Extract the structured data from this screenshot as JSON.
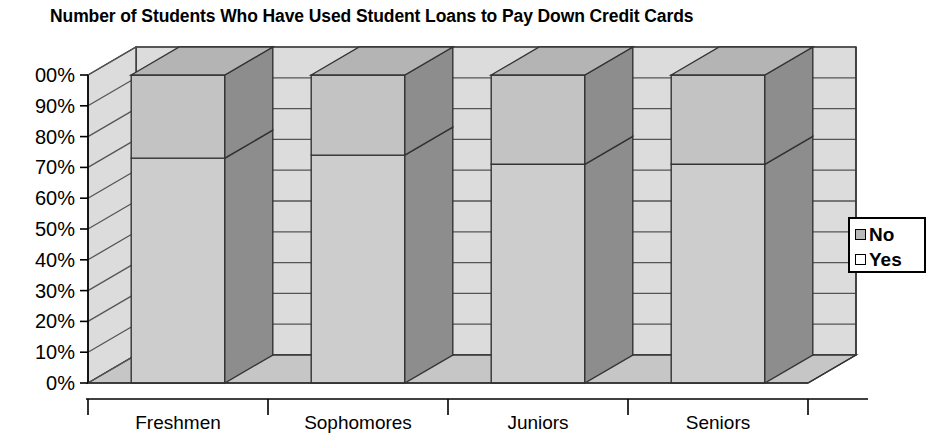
{
  "chart_data": {
    "type": "bar",
    "subtype": "stacked-column-3d",
    "title": "Number of Students Who Have Used Student Loans to Pay Down Credit Cards",
    "xlabel": "",
    "ylabel": "",
    "categories": [
      "Freshmen",
      "Sophomores",
      "Juniors",
      "Seniors"
    ],
    "series": [
      {
        "name": "Yes",
        "values": [
          73,
          74,
          71,
          71
        ],
        "color": "#c9c9c9"
      },
      {
        "name": "No",
        "values": [
          27,
          26,
          29,
          29
        ],
        "color": "#b8b8b8"
      }
    ],
    "ylim": [
      0,
      100
    ],
    "ytick_labels": [
      "00%",
      "90%",
      "80%",
      "70%",
      "60%",
      "50%",
      "40%",
      "30%",
      "20%",
      "10%",
      "0%"
    ],
    "ytick_values": [
      100,
      90,
      80,
      70,
      60,
      50,
      40,
      30,
      20,
      10,
      0
    ],
    "grid": true,
    "legend_position": "right",
    "legend_entries": [
      "No",
      "Yes"
    ],
    "stack_order_bottom_to_top": [
      "Yes",
      "No"
    ]
  },
  "colors": {
    "bar_front_yes": "#cdcdcd",
    "bar_front_no": "#c3c3c3",
    "bar_side": "#8d8d8d",
    "bar_top": "#b4b4b4",
    "wall": "#dcdcdc",
    "floor": "#c6c6c6",
    "outline": "#333333",
    "gridline": "#555555",
    "text": "#000000"
  },
  "legend": {
    "entries": [
      {
        "label": "No",
        "swatch": "series-no"
      },
      {
        "label": "Yes",
        "swatch": "series-yes"
      }
    ]
  }
}
